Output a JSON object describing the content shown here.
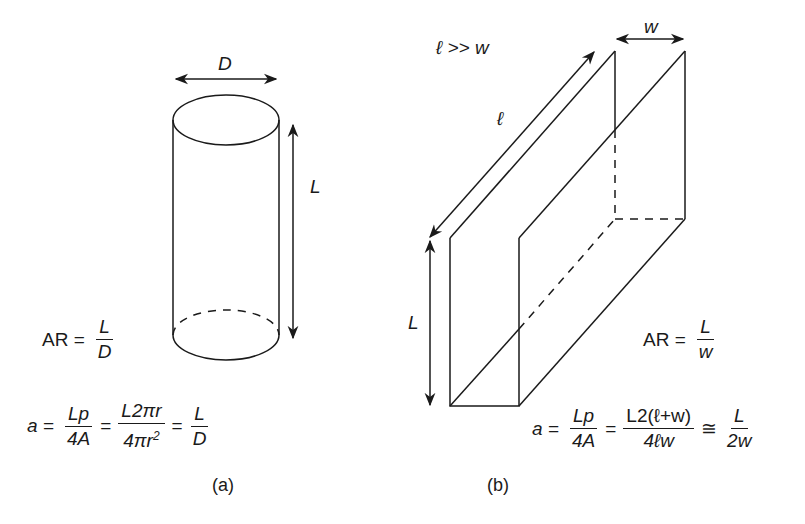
{
  "panel_a": {
    "caption": "(a)",
    "dim_diameter": "D",
    "dim_length": "L",
    "ar_eq": {
      "lhs": "AR =",
      "num": "L",
      "den": "D"
    },
    "a_eq": {
      "lhs": "a =",
      "f1_num": "Lp",
      "f1_den": "4A",
      "op1": "=",
      "f2_num": "L2πr",
      "f2_den_main": "4πr",
      "f2_den_sup": "2",
      "op2": "=",
      "f3_num": "L",
      "f3_den": "D"
    }
  },
  "panel_b": {
    "caption": "(b)",
    "condition": "ℓ >> w",
    "dim_width": "w",
    "dim_depth": "ℓ",
    "dim_length": "L",
    "ar_eq": {
      "lhs": "AR =",
      "num": "L",
      "den": "w"
    },
    "a_eq": {
      "lhs": "a =",
      "f1_num": "Lp",
      "f1_den": "4A",
      "op1": "=",
      "f2_num": "L2(ℓ+w)",
      "f2_den": "4ℓw",
      "op2": "≅",
      "f3_num": "L",
      "f3_den": "2w"
    }
  }
}
